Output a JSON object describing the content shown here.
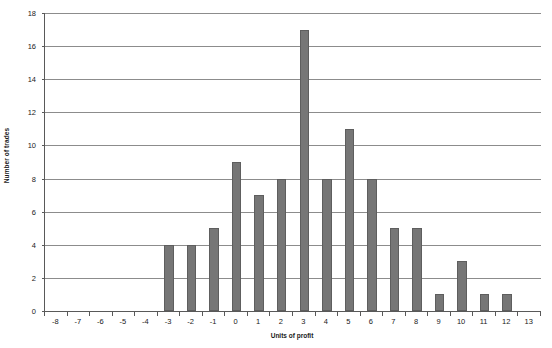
{
  "chart_data": {
    "type": "bar",
    "title": "",
    "xlabel": "Units of profit",
    "ylabel": "Number of trades",
    "categories": [
      -8,
      -7,
      -6,
      -5,
      -4,
      -3,
      -2,
      -1,
      0,
      1,
      2,
      3,
      4,
      5,
      6,
      7,
      8,
      9,
      10,
      11,
      12,
      13
    ],
    "values": [
      0,
      0,
      0,
      0,
      0,
      4,
      4,
      5,
      9,
      7,
      8,
      17,
      8,
      11,
      8,
      5,
      5,
      1,
      3,
      1,
      1,
      0
    ],
    "xlim": [
      -8,
      13
    ],
    "ylim": [
      0,
      18
    ],
    "y_ticks": [
      0,
      2,
      4,
      6,
      8,
      10,
      12,
      14,
      16,
      18
    ],
    "x_ticks": [
      "-8",
      "-7",
      "-6",
      "-5",
      "-4",
      "-3",
      "-2",
      "-1",
      "0",
      "1",
      "2",
      "3",
      "4",
      "5",
      "6",
      "7",
      "8",
      "9",
      "10",
      "11",
      "12",
      "13"
    ],
    "grid": "horizontal",
    "legend": "none",
    "bar_color": "#767676",
    "gridline_color": "#8c8c8c",
    "axis_color": "#595959"
  }
}
